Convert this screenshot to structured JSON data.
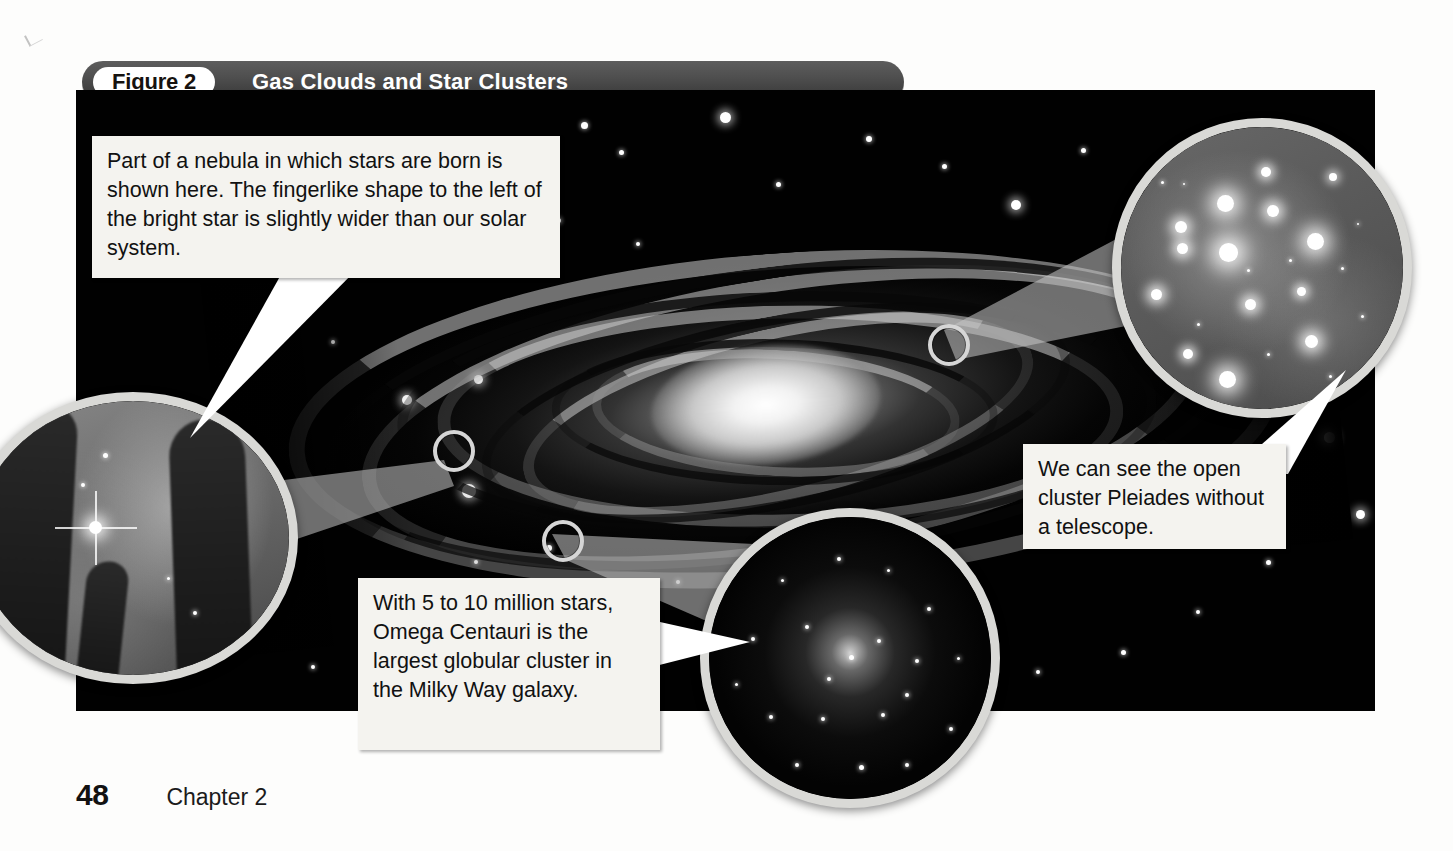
{
  "figure": {
    "label": "Figure 2",
    "title": "Gas Clouds and Star Clusters",
    "banner_color": "#4a4a4a",
    "label_pill_color": "#ffffff",
    "plate_color": "#010101"
  },
  "callouts": [
    {
      "id": "nebula",
      "name": "nebula-inset",
      "caption": "Part of a nebula in which stars are born is shown here. The fingerlike shape to the left of the bright star is slightly wider than our solar system.",
      "subject": "Eagle Nebula pillars"
    },
    {
      "id": "pleiades",
      "name": "pleiades-inset",
      "caption": "We can see the open cluster Pleiades without a telescope.",
      "subject": "Pleiades open cluster"
    },
    {
      "id": "omega-centauri",
      "name": "globular-cluster-inset",
      "caption": "With 5 to 10 million stars, Omega Centauri is the largest globular cluster in the Milky Way galaxy.",
      "subject": "Omega Centauri globular cluster"
    }
  ],
  "main_photo": {
    "subject": "Milky Way spiral galaxy",
    "alt": "Edge-on view of a spiral galaxy with bright core and dust lanes against a black star field"
  },
  "footer": {
    "page_number": "48",
    "chapter": "Chapter 2"
  }
}
